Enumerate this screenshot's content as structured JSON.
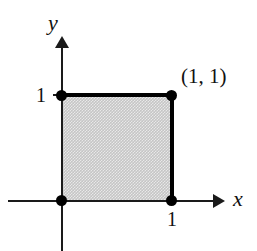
{
  "figure": {
    "axes": {
      "x_label": "x",
      "y_label": "y",
      "x_axis_name": "x-axis",
      "y_axis_name": "y-axis"
    },
    "ticks": {
      "y_one": "1",
      "x_one": "1"
    },
    "annotations": {
      "corner_point": "(1, 1)"
    },
    "colors": {
      "region_fill": "#c5c5c5",
      "boundary": "#000000",
      "axis": "#1a1a1a",
      "point": "#000000",
      "background": "#ffffff"
    }
  },
  "chart_data": {
    "type": "scatter",
    "title": "",
    "xlabel": "x",
    "ylabel": "y",
    "xlim": [
      -0.5,
      1.5
    ],
    "ylim": [
      -0.25,
      1.5
    ],
    "grid": false,
    "legend": null,
    "shaded_region": {
      "name": "unit square",
      "vertices": [
        [
          0,
          0
        ],
        [
          1,
          0
        ],
        [
          1,
          1
        ],
        [
          0,
          1
        ]
      ],
      "fill": "#c5c5c5",
      "emphasized_edges": [
        {
          "from": [
            0,
            1
          ],
          "to": [
            1,
            1
          ],
          "name": "top edge"
        },
        {
          "from": [
            1,
            0
          ],
          "to": [
            1,
            1
          ],
          "name": "right edge"
        }
      ]
    },
    "points": [
      {
        "x": 0,
        "y": 0,
        "label": ""
      },
      {
        "x": 1,
        "y": 0,
        "label": ""
      },
      {
        "x": 0,
        "y": 1,
        "label": ""
      },
      {
        "x": 1,
        "y": 1,
        "label": "(1, 1)"
      }
    ],
    "xticks": [
      1
    ],
    "xticklabels": [
      "1"
    ],
    "yticks": [
      1
    ],
    "yticklabels": [
      "1"
    ],
    "annotations": [
      {
        "text": "(1, 1)",
        "x": 1,
        "y": 1,
        "position": "upper-right"
      }
    ]
  }
}
